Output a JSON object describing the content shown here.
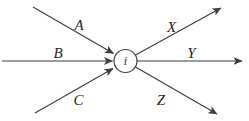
{
  "diagram": {
    "background_color": "#ffffff",
    "line_color": "#3f3f3f",
    "text_color": "#1f1f1f",
    "node": {
      "label": "i",
      "cx": 125.5,
      "cy": 61,
      "r": 11.5
    },
    "edges": [
      {
        "id": "A",
        "label": "A",
        "direction": "incoming",
        "x1": 33,
        "y1": 7,
        "x2": 113.5,
        "y2": 53.5,
        "label_x": 79,
        "label_y": 29.5
      },
      {
        "id": "B",
        "label": "B",
        "direction": "incoming",
        "x1": 2,
        "y1": 61,
        "x2": 112.5,
        "y2": 61,
        "label_x": 58,
        "label_y": 58
      },
      {
        "id": "C",
        "label": "C",
        "direction": "incoming",
        "x1": 35,
        "y1": 113,
        "x2": 113,
        "y2": 68.5,
        "label_x": 78.5,
        "label_y": 105
      },
      {
        "id": "X",
        "label": "X",
        "direction": "outgoing",
        "x1": 135.5,
        "y1": 55,
        "x2": 221,
        "y2": 8,
        "label_x": 171.5,
        "label_y": 31.5
      },
      {
        "id": "Y",
        "label": "Y",
        "direction": "outgoing",
        "x1": 137,
        "y1": 61,
        "x2": 242,
        "y2": 61,
        "label_x": 191.5,
        "label_y": 57.5
      },
      {
        "id": "Z",
        "label": "Z",
        "direction": "outgoing",
        "x1": 135.5,
        "y1": 67,
        "x2": 217,
        "y2": 114,
        "label_x": 161,
        "label_y": 104.5
      }
    ]
  }
}
